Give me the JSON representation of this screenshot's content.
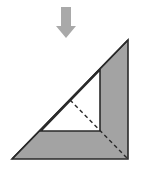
{
  "diagram": {
    "colors": {
      "arrow": "#a9a9a9",
      "shaded": "#a3a3a3",
      "outline": "#2a2a2a",
      "inner": "#ffffff"
    },
    "arrow": {
      "icon": "arrow-down-icon"
    },
    "outer_triangle": {
      "points": "12,159 128,40 128,159"
    },
    "inner_triangle": {
      "points": "41,131 100,70 100,131"
    },
    "fold_line": {
      "x1": 70,
      "y1": 100,
      "x2": 127,
      "y2": 158,
      "style": "dashed"
    }
  }
}
